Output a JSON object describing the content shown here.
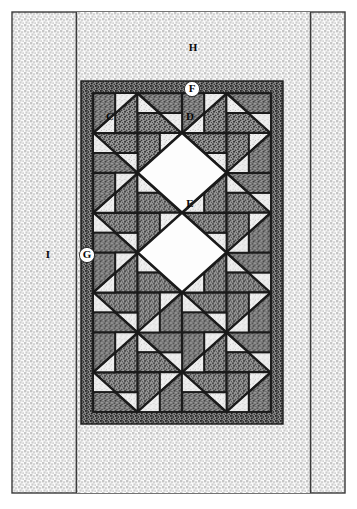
{
  "diagram": {
    "type": "quilt-assembly-diagram",
    "canvas": {
      "width": 357,
      "height": 509
    }
  },
  "labels": {
    "C": {
      "text": "C",
      "x": 110,
      "y": 117,
      "style": "plain",
      "meaning": "corner-triangle-patch"
    },
    "D": {
      "text": "D",
      "x": 190,
      "y": 117,
      "style": "plain",
      "meaning": "setting-triangle-patch"
    },
    "E": {
      "text": "E",
      "x": 190,
      "y": 204,
      "style": "plain",
      "meaning": "center-square-patch"
    },
    "F": {
      "text": "F",
      "x": 192,
      "y": 89,
      "style": "circled",
      "meaning": "inner-border-top"
    },
    "G": {
      "text": "G",
      "x": 87,
      "y": 255,
      "style": "circled",
      "meaning": "inner-border-side"
    },
    "H": {
      "text": "H",
      "x": 193,
      "y": 48,
      "style": "plain",
      "meaning": "outer-border-top"
    },
    "I": {
      "text": "I",
      "x": 48,
      "y": 255,
      "style": "plain",
      "meaning": "outer-border-side"
    }
  },
  "geometry": {
    "outer_rect": {
      "x": 12,
      "y": 12,
      "w": 333,
      "h": 481
    },
    "inner_panel": {
      "x": 76,
      "y": 12,
      "w": 234,
      "h": 481
    },
    "border_f_g": {
      "x": 81,
      "y": 81,
      "w": 202,
      "h": 343,
      "band": 12
    },
    "field": {
      "x": 93,
      "y": 93,
      "w": 178,
      "h": 319
    },
    "block_cols": 2,
    "block_rows": 4,
    "block_w": 89,
    "block_h": 79.75
  },
  "colors": {
    "paper": "#ffffff",
    "line": "#1a1a1a",
    "outline_rule": "#3a3a3a",
    "patch_dark": "#6f6f6f",
    "patch_mid": "#b9b9b9",
    "patch_light": "#f3f3f3",
    "fabric_light_bg": "#fbfbfb",
    "fabric_light_fg": "#c9c9c9",
    "fabric_dark_bg": "#9a9a9a",
    "fabric_dark_fg": "#2b2b2b"
  },
  "legend": {
    "fabrics": [
      {
        "key": "C",
        "label": "C",
        "fabric": "background-white"
      },
      {
        "key": "D",
        "label": "D",
        "fabric": "background-white"
      },
      {
        "key": "E",
        "label": "E",
        "fabric": "background-white"
      },
      {
        "key": "F",
        "label": "F",
        "fabric": "dark-print-inner-border"
      },
      {
        "key": "G",
        "label": "G",
        "fabric": "dark-print-inner-border"
      },
      {
        "key": "H",
        "label": "H",
        "fabric": "light-print-outer-border"
      },
      {
        "key": "I",
        "label": "I",
        "fabric": "light-print-outer-border"
      }
    ]
  }
}
